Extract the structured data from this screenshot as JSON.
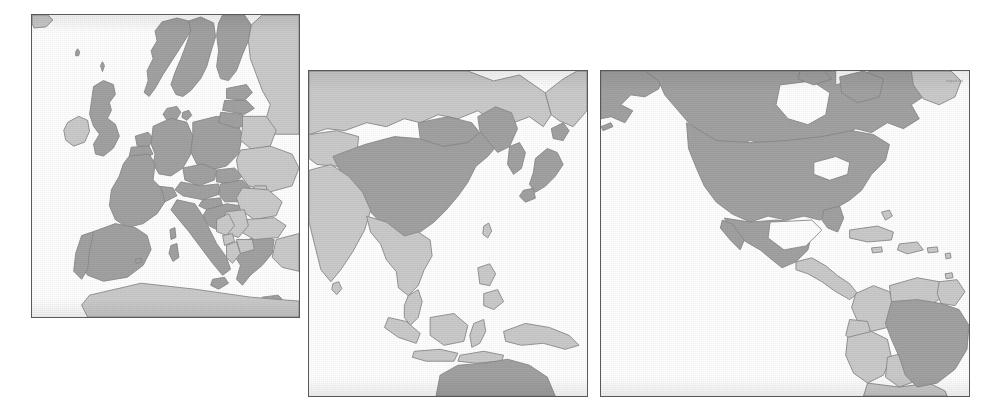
{
  "figure": {
    "title": "",
    "caption": "",
    "background_color": "#ffffff",
    "border_color": "#595959",
    "fill_highlight": "#a2a2a2",
    "fill_other": "#cbcbcb",
    "stroke_color": "#8a8a8a",
    "ocean_color": "#ffffff"
  },
  "legend": {
    "highlight_label": "highlighted countries",
    "other_label": "other countries",
    "ocean_label": "ocean / no data"
  },
  "panels": [
    {
      "id": "panel-europe",
      "name": "Europe",
      "order": 1,
      "x": 31,
      "y": 14,
      "width": 269,
      "height": 304,
      "highlighted_countries": [
        "Norway",
        "Sweden",
        "Finland",
        "Denmark",
        "United Kingdom",
        "Germany",
        "Netherlands",
        "Belgium",
        "Luxembourg",
        "France",
        "Spain",
        "Portugal",
        "Italy",
        "Switzerland",
        "Austria",
        "Czech Republic",
        "Slovakia",
        "Poland",
        "Hungary",
        "Slovenia",
        "Croatia",
        "Greece",
        "Estonia",
        "Latvia",
        "Lithuania"
      ],
      "other_countries": [
        "Iceland",
        "Ireland",
        "Belarus",
        "Ukraine",
        "Moldova",
        "Romania",
        "Bulgaria",
        "Serbia",
        "Bosnia and Herzegovina",
        "Albania",
        "North Macedonia",
        "Montenegro",
        "Russia",
        "Turkey",
        "Morocco",
        "Algeria",
        "Tunisia"
      ]
    },
    {
      "id": "panel-asia-pacific",
      "name": "East Asia and Oceania",
      "order": 2,
      "x": 308,
      "y": 70,
      "width": 280,
      "height": 327,
      "highlighted_countries": [
        "China",
        "Japan",
        "South Korea",
        "North Korea",
        "Mongolia",
        "Australia"
      ],
      "other_countries": [
        "Russia",
        "Kazakhstan",
        "India",
        "Nepal",
        "Bhutan",
        "Bangladesh",
        "Myanmar",
        "Thailand",
        "Laos",
        "Vietnam",
        "Cambodia",
        "Malaysia",
        "Indonesia",
        "Philippines",
        "Papua New Guinea",
        "Taiwan",
        "Sri Lanka"
      ]
    },
    {
      "id": "panel-americas",
      "name": "Americas",
      "order": 3,
      "x": 600,
      "y": 70,
      "width": 370,
      "height": 327,
      "highlighted_countries": [
        "United States",
        "Canada",
        "Mexico",
        "Brazil"
      ],
      "other_countries": [
        "Greenland",
        "Guatemala",
        "Belize",
        "Honduras",
        "El Salvador",
        "Nicaragua",
        "Costa Rica",
        "Panama",
        "Cuba",
        "Haiti",
        "Dominican Republic",
        "Jamaica",
        "Bahamas",
        "Colombia",
        "Venezuela",
        "Guyana",
        "Suriname",
        "French Guiana",
        "Ecuador",
        "Peru",
        "Bolivia",
        "Paraguay",
        "Chile",
        "Argentina"
      ]
    }
  ],
  "watermark": {
    "visible": true,
    "text": "mapsof.net"
  }
}
